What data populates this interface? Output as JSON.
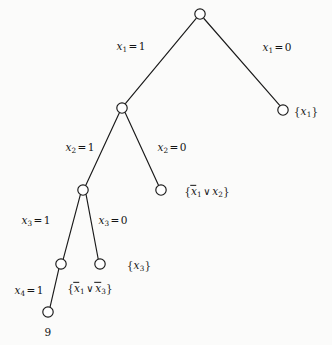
{
  "figure": {
    "name": "dpll-search-tree",
    "background_color": "#fbfbfa",
    "stroke_color": "#1a1a1a",
    "node_fill": "#ffffff",
    "node_radius": 5.2
  },
  "nodes": [
    {
      "id": "root",
      "x": 200,
      "y": 14,
      "label": ""
    },
    {
      "id": "n1",
      "x": 122,
      "y": 108,
      "label": ""
    },
    {
      "id": "leafA",
      "x": 283,
      "y": 110,
      "label": "{x1}"
    },
    {
      "id": "n2",
      "x": 83,
      "y": 190,
      "label": ""
    },
    {
      "id": "leafB",
      "x": 161,
      "y": 190,
      "label": "{not-x1 or x2}"
    },
    {
      "id": "n3",
      "x": 61,
      "y": 264,
      "label": ""
    },
    {
      "id": "leafC",
      "x": 100,
      "y": 264,
      "label": "{x3}"
    },
    {
      "id": "n4",
      "x": 48,
      "y": 312,
      "label": "9"
    }
  ],
  "edges": [
    {
      "from": "root",
      "to": "n1",
      "label": "x1 = 1"
    },
    {
      "from": "root",
      "to": "leafA",
      "label": "x1 = 0"
    },
    {
      "from": "n1",
      "to": "n2",
      "label": "x2 = 1"
    },
    {
      "from": "n1",
      "to": "leafB",
      "label": "x2 = 0"
    },
    {
      "from": "n2",
      "to": "n3",
      "label": "x3 = 1"
    },
    {
      "from": "n2",
      "to": "leafC",
      "label": "x3 = 0"
    },
    {
      "from": "n3",
      "to": "n4",
      "label": "x4 = 1"
    }
  ],
  "edge_labels": {
    "x1_true": {
      "var": "x",
      "sub": "1",
      "value": "1",
      "x": 131,
      "y": 47
    },
    "x1_false": {
      "var": "x",
      "sub": "1",
      "value": "0",
      "x": 277,
      "y": 48
    },
    "x2_true": {
      "var": "x",
      "sub": "2",
      "value": "1",
      "x": 80,
      "y": 148
    },
    "x2_false": {
      "var": "x",
      "sub": "2",
      "value": "0",
      "x": 172,
      "y": 148
    },
    "x3_true": {
      "var": "x",
      "sub": "3",
      "value": "1",
      "x": 36,
      "y": 221
    },
    "x3_false": {
      "var": "x",
      "sub": "3",
      "value": "0",
      "x": 113,
      "y": 221
    },
    "x4_true": {
      "var": "x",
      "sub": "4",
      "value": "1",
      "x": 29,
      "y": 291
    }
  },
  "leaf_labels": {
    "clause_x1": {
      "x": 306,
      "y": 112,
      "text": "{x1}"
    },
    "clause_nx1_or_x2": {
      "x": 207,
      "y": 192,
      "text": "{x̄1 ∨ x2}"
    },
    "clause_x3": {
      "x": 139,
      "y": 266,
      "text": "{x3}"
    },
    "clause_nx1_or_nx3": {
      "x": 90,
      "y": 289,
      "text": "{x̄1 ∨ x̄3}"
    },
    "node_number_9": {
      "x": 48,
      "y": 332,
      "text": "9"
    }
  }
}
